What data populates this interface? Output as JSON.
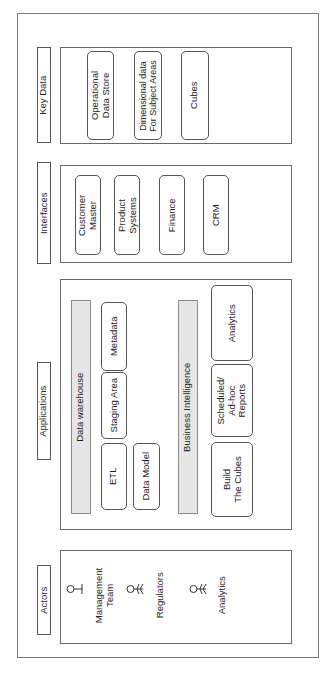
{
  "diagram": {
    "orientation": "rotated -90deg",
    "colors": {
      "border": "#555555",
      "bar_fill": "#e6e6e6",
      "background": "#ffffff"
    },
    "lanes": [
      {
        "title": "Key Data",
        "items": [
          "Operational\nData Store",
          "Dimensional data\nFor Subject Areas",
          "Cubes"
        ]
      },
      {
        "title": "Interfaces",
        "items": [
          "Customer\nMaster",
          "Product\nSystems",
          "Finance",
          "CRM"
        ]
      },
      {
        "title": "Applications",
        "groups": [
          {
            "title": "Data warehouse",
            "items": [
              "Metadata",
              "Staging Area",
              "ETL",
              "Data Model"
            ]
          },
          {
            "title": "Business Intelligence",
            "items": [
              "Analytics",
              "Scheduled/\nAd-hoc\nReports",
              "Build\nThe Cubes"
            ]
          }
        ]
      },
      {
        "title": "Actors",
        "actors": [
          {
            "label": "Management\nTeam",
            "icon": "person-icon"
          },
          {
            "label": "Regulators",
            "icon": "stick-figure-icon"
          },
          {
            "label": "Analytics",
            "icon": "stick-figure-icon"
          }
        ]
      }
    ]
  }
}
